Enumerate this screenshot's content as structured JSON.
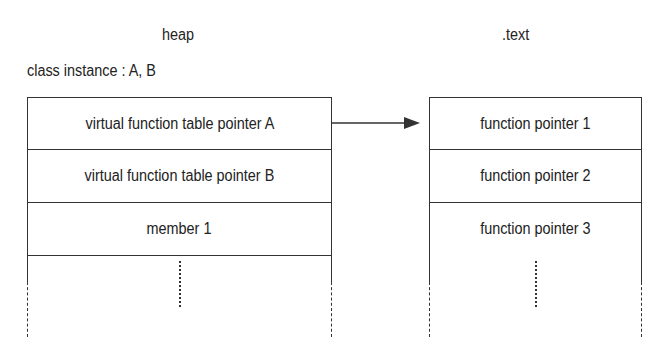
{
  "diagram": {
    "heap": {
      "title": "heap",
      "subtitle": "class instance : A, B",
      "rows": [
        "virtual function table pointer A",
        "virtual function table pointer B",
        "member 1"
      ]
    },
    "text": {
      "title": ".text",
      "rows": [
        "function pointer 1",
        "function pointer 2",
        "function pointer 3"
      ]
    },
    "arrow": {
      "from": "virtual function table pointer A",
      "to": "function pointer 1"
    },
    "colors": {
      "line": "#333333",
      "text": "#222222",
      "background": "#ffffff"
    }
  }
}
